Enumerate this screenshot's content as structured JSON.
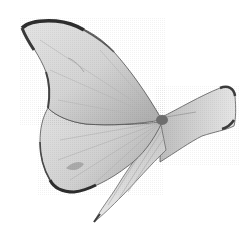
{
  "image": {
    "subject": "butterfly",
    "description": "Grayscale photo of a pale butterfly in flight, side view, on a white background",
    "background_color": "#ffffff",
    "colors": {
      "wing_light": "#ececec",
      "wing_mid": "#c9c9c9",
      "wing_shadow": "#9a9a9a",
      "edge_dark": "#3c3c3c"
    }
  }
}
